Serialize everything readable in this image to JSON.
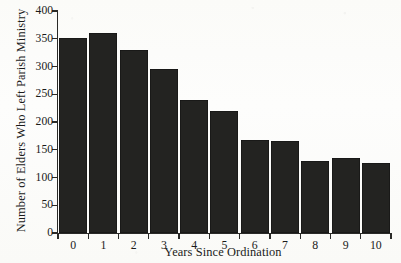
{
  "chart_data": {
    "type": "bar",
    "title": "",
    "xlabel": "Years Since Ordination",
    "ylabel": "Number of Elders Who Left Parish Ministry",
    "categories": [
      "0",
      "1",
      "2",
      "3",
      "4",
      "5",
      "6",
      "7",
      "8",
      "9",
      "10"
    ],
    "values": [
      352,
      360,
      330,
      295,
      240,
      220,
      167,
      166,
      130,
      135,
      127
    ],
    "ylim": [
      0,
      400
    ],
    "yticks": [
      0,
      50,
      100,
      150,
      200,
      250,
      300,
      350,
      400
    ],
    "ytick_labels": [
      "0",
      "50",
      "100",
      "150",
      "200",
      "250",
      "300",
      "350",
      "400"
    ],
    "grid": false,
    "legend": false,
    "bar_color": "#232321",
    "background_color": "#fdfdfb",
    "axis_color": "#2a2a28"
  }
}
